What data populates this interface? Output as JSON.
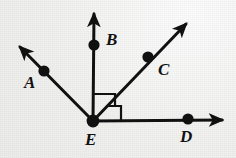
{
  "figure": {
    "type": "geometry-diagram",
    "background_color": "#f0f0ef",
    "stroke_color": "#111111",
    "canvas": {
      "width": 236,
      "height": 158
    },
    "vertex": {
      "name": "E",
      "label": "E",
      "x": 93,
      "y": 121,
      "label_x": 85,
      "label_y": 131
    },
    "points": [
      {
        "name": "A",
        "label": "A",
        "x": 44,
        "y": 71,
        "label_x": 24,
        "label_y": 74
      },
      {
        "name": "B",
        "label": "B",
        "x": 94,
        "y": 45,
        "label_x": 106,
        "label_y": 31
      },
      {
        "name": "C",
        "label": "C",
        "x": 148,
        "y": 57,
        "label_x": 158,
        "label_y": 61
      },
      {
        "name": "D",
        "label": "D",
        "x": 188,
        "y": 119,
        "label_x": 180,
        "label_y": 128
      }
    ],
    "rays": [
      {
        "name": "ray-EA",
        "from": "E",
        "through": "A",
        "tip_x": 18,
        "tip_y": 45
      },
      {
        "name": "ray-EB",
        "from": "E",
        "through": "B",
        "tip_x": 94,
        "tip_y": 11
      },
      {
        "name": "ray-EC",
        "from": "E",
        "through": "C",
        "tip_x": 189,
        "tip_y": 21
      },
      {
        "name": "ray-ED",
        "from": "E",
        "through": "D",
        "tip_x": 226,
        "tip_y": 120
      }
    ],
    "right_angle_marks": [
      {
        "name": "right-angle-BEC",
        "between": "ray-EB and ray-EC",
        "size": 15
      },
      {
        "name": "right-angle-CED",
        "between": "ray-EC and ray-ED",
        "size": 15
      }
    ]
  }
}
